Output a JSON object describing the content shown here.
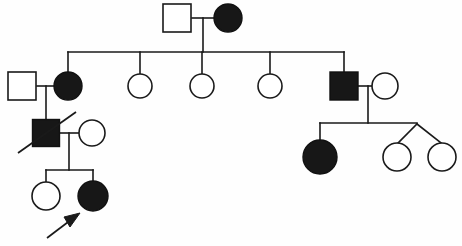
{
  "figure": {
    "kind": "pedigree-chart",
    "width": 462,
    "height": 246,
    "background_color": "#fefefe",
    "line_color": "#1a1a1a",
    "affected_fill_color": "#171717",
    "unaffected_fill_color": "#ffffff"
  },
  "legend_semantics": {
    "square": "male",
    "circle": "female",
    "filled": "affected",
    "unfilled": "unaffected",
    "slash": "deceased",
    "arrow": "proband",
    "v-connector": "twins"
  },
  "generations": [
    {
      "id": "I",
      "individuals": [
        {
          "id": "I-1",
          "sex": "male",
          "shape": "square",
          "affected": false,
          "cx": 177,
          "cy": 18,
          "size": 28
        },
        {
          "id": "I-2",
          "sex": "female",
          "shape": "circle",
          "affected": true,
          "cx": 228,
          "cy": 18,
          "r": 14
        }
      ]
    },
    {
      "id": "II",
      "individuals": [
        {
          "id": "II-0",
          "sex": "male",
          "shape": "square",
          "affected": false,
          "cx": 22,
          "cy": 86,
          "size": 28,
          "role": "spouse-married-in"
        },
        {
          "id": "II-1",
          "sex": "female",
          "shape": "circle",
          "affected": true,
          "cx": 68,
          "cy": 86,
          "r": 14
        },
        {
          "id": "II-2",
          "sex": "female",
          "shape": "circle",
          "affected": false,
          "cx": 140,
          "cy": 86,
          "r": 12
        },
        {
          "id": "II-3",
          "sex": "female",
          "shape": "circle",
          "affected": false,
          "cx": 202,
          "cy": 86,
          "r": 12
        },
        {
          "id": "II-4",
          "sex": "female",
          "shape": "circle",
          "affected": false,
          "cx": 270,
          "cy": 86,
          "r": 12
        },
        {
          "id": "II-5",
          "sex": "male",
          "shape": "square",
          "affected": true,
          "cx": 344,
          "cy": 86,
          "size": 28
        },
        {
          "id": "II-6",
          "sex": "female",
          "shape": "circle",
          "affected": false,
          "cx": 385,
          "cy": 86,
          "r": 13,
          "role": "spouse-married-in"
        }
      ]
    },
    {
      "id": "III",
      "individuals": [
        {
          "id": "III-1",
          "sex": "male",
          "shape": "square",
          "affected": true,
          "deceased": true,
          "cx": 46,
          "cy": 133,
          "size": 27
        },
        {
          "id": "III-2",
          "sex": "female",
          "shape": "circle",
          "affected": false,
          "cx": 92,
          "cy": 133,
          "r": 13,
          "role": "spouse-married-in"
        },
        {
          "id": "III-3",
          "sex": "female",
          "shape": "circle",
          "affected": true,
          "cx": 320,
          "cy": 157,
          "r": 17
        },
        {
          "id": "III-4",
          "sex": "female",
          "shape": "circle",
          "affected": false,
          "cx": 397,
          "cy": 157,
          "r": 14,
          "twin": true
        },
        {
          "id": "III-5",
          "sex": "female",
          "shape": "circle",
          "affected": false,
          "cx": 442,
          "cy": 157,
          "r": 14,
          "twin": true
        }
      ]
    },
    {
      "id": "IV",
      "individuals": [
        {
          "id": "IV-1",
          "sex": "female",
          "shape": "circle",
          "affected": false,
          "cx": 46,
          "cy": 196,
          "r": 14
        },
        {
          "id": "IV-2",
          "sex": "female",
          "shape": "circle",
          "affected": true,
          "proband": true,
          "cx": 93,
          "cy": 196,
          "r": 15
        }
      ]
    }
  ],
  "connectors": {
    "mating_lines": [
      {
        "name": "mating-I1-I2",
        "x1": 192,
        "y": 18,
        "x2": 214
      },
      {
        "name": "mating-II0-II1",
        "x1": 37,
        "y": 86,
        "x2": 55
      },
      {
        "name": "mating-II5-II6",
        "x1": 358,
        "y": 86,
        "x2": 372
      },
      {
        "name": "mating-III1-III2",
        "x1": 60,
        "y": 133,
        "x2": 79
      }
    ],
    "descent_drops": [
      {
        "name": "drop-gen1-to-sibline",
        "x": 203,
        "y1": 18,
        "y2": 52
      },
      {
        "name": "drop-II1-couple",
        "x": 46,
        "y1": 86,
        "y2": 120
      },
      {
        "name": "drop-II5-couple",
        "x": 368,
        "y1": 86,
        "y2": 123
      },
      {
        "name": "drop-III1-couple",
        "x": 69,
        "y1": 133,
        "y2": 170
      }
    ],
    "sibship_lines": [
      {
        "name": "sibline-gen2",
        "x1": 68,
        "y": 52,
        "x2": 344,
        "children_x": [
          68,
          140,
          202,
          270,
          344
        ]
      },
      {
        "name": "sibline-gen3-right",
        "x1": 320,
        "y": 123,
        "x2": 417,
        "children_x": [
          320
        ]
      },
      {
        "name": "sibline-gen4-left",
        "x1": 46,
        "y": 170,
        "x2": 93,
        "children_x": [
          46,
          93
        ]
      }
    ],
    "twin_connector": {
      "name": "twin-apex",
      "apex_x": 417,
      "apex_y": 123,
      "left_x": 397,
      "right_x": 442,
      "child_y": 143
    }
  },
  "proband_marker": {
    "name": "proband-arrow",
    "tail_x": 47,
    "tail_y": 238,
    "tip_x": 79,
    "tip_y": 214
  },
  "deceased_marker": {
    "name": "deceased-slash",
    "x1": 18,
    "y1": 153,
    "x2": 76,
    "y2": 112
  }
}
